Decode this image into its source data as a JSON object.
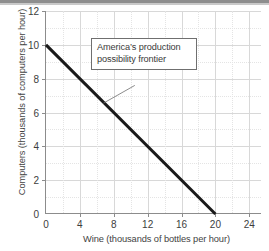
{
  "chart_data": {
    "type": "line",
    "title": "",
    "xlabel": "Wine (thousands of bottles per hour)",
    "ylabel": "Computers (thousands of computers per hour)",
    "xlim": [
      0,
      25.5
    ],
    "ylim": [
      0,
      12
    ],
    "xticks": [
      0,
      4,
      8,
      12,
      16,
      20,
      24
    ],
    "xtick_labels": [
      "0",
      "4",
      "8",
      "12",
      "16",
      "20",
      "24"
    ],
    "yticks": [
      0,
      2,
      4,
      6,
      8,
      10,
      12
    ],
    "ytick_labels": [
      "0",
      "2",
      "4",
      "6",
      "8",
      "10",
      "12"
    ],
    "x_minor_step": 2,
    "y_minor_step": 1,
    "grid": true,
    "legend": "none",
    "series": [
      {
        "name": "America's production possibility frontier",
        "color": "#1a1a1a",
        "linewidth": 3,
        "x": [
          0,
          20
        ],
        "y": [
          10,
          0
        ],
        "points": [
          {
            "x": 0,
            "y": 10
          },
          {
            "x": 20,
            "y": 0
          }
        ]
      }
    ],
    "annotations": [
      {
        "id": "ppf-callout",
        "line1": "America’s production",
        "line2": "possibility frontier",
        "box_x": 4.3,
        "box_y": 10.6,
        "leader_from": {
          "x": 10.6,
          "y": 7.6
        },
        "leader_to": {
          "x": 6.9,
          "y": 6.55
        }
      }
    ]
  },
  "axes": {
    "x_title": "Wine (thousands of bottles per hour)",
    "y_title": "Computers (thousands of computers per hour)"
  },
  "annotation": {
    "line1": "America’s production",
    "line2": "possibility frontier"
  },
  "colors": {
    "line": "#1a1a1a",
    "axis": "#8c8c8c",
    "grid_major": "#d8d8d8",
    "grid_minor": "#e4e4e4",
    "text": "#3a3a3a",
    "background": "#ffffff"
  }
}
